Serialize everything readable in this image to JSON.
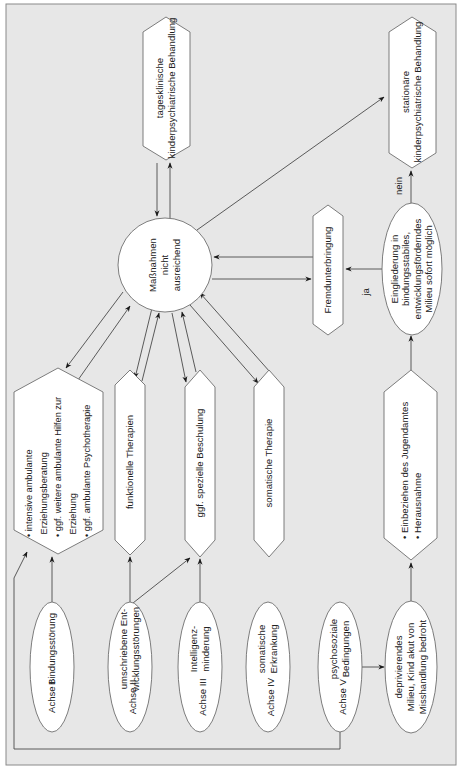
{
  "diagram": {
    "center": {
      "lines": [
        "Maßnahmen",
        "nicht",
        "ausreichend"
      ]
    },
    "top_nodes": {
      "day_clinic": {
        "lines": [
          "tagesklinische",
          "kinderpsychiatrische Behandlung"
        ]
      },
      "inpatient": {
        "lines": [
          "stationäre",
          "kinderpsychiatrische Behandlung"
        ]
      },
      "foster": {
        "lines": [
          "Fremdunterbringung"
        ]
      },
      "decision": {
        "lines": [
          "Eingliederung in",
          "bindungsstabiles,",
          "entwicklungsförderndes",
          "Milieu sofort möglich"
        ]
      }
    },
    "edge_labels": {
      "yes": "ja",
      "no": "nein"
    },
    "measures": [
      {
        "id": "ambulant",
        "lines": [
          "• intensive ambulante",
          "  Erziehungsberatung",
          "• ggf. weitere ambulante Hilfen zur",
          "  Erziehung",
          "• ggf. ambulante Psychotherapie"
        ]
      },
      {
        "id": "functional",
        "lines": [
          "funktionelle Therapien"
        ]
      },
      {
        "id": "schooling",
        "lines": [
          "ggf. spezielle Beschulung"
        ]
      },
      {
        "id": "somatic",
        "lines": [
          "somatische Therapie"
        ]
      },
      {
        "id": "youth_office",
        "lines": [
          "• Einbeziehen des Jugendamtes",
          "• Herausnahme"
        ]
      }
    ],
    "axes": [
      {
        "axis": "Achse I",
        "lines": [
          "Bindungsstörung"
        ]
      },
      {
        "axis": "Achse II",
        "lines": [
          "umschriebene Ent-",
          "wicklungsstörungen"
        ]
      },
      {
        "axis": "Achse III",
        "lines": [
          "Intelligenz-",
          "minderung"
        ]
      },
      {
        "axis": "Achse IV",
        "lines": [
          "somatische",
          "Erkrankung"
        ]
      },
      {
        "axis": "Achse V",
        "lines": [
          "psychosoziale",
          "Bedingungen"
        ]
      }
    ],
    "deprivation": {
      "lines": [
        "deprivierendes",
        "Milieu, Kind akut von",
        "Misshandlung bedroht"
      ]
    }
  }
}
